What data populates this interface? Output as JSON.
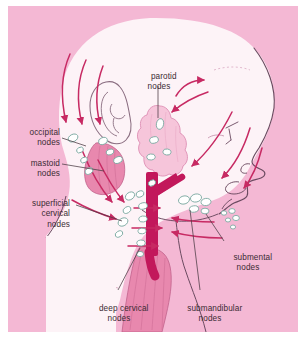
{
  "figure": {
    "panel_background": "#f4b8d4",
    "frame_background": "#ffffff"
  },
  "colors": {
    "panel_pink": "#f4b8d4",
    "skin_white": "#fdf3f7",
    "vessel_crimson": "#c2185b",
    "arrow_crimson": "#c72a63",
    "muscle_pink": "#e888ae",
    "gland_pink": "#f6c5da",
    "outline_purple": "#6b4a60",
    "node_fill": "#ffffff",
    "node_outline": "#7aa8a0",
    "leader_line": "#4a3a42",
    "text": "#3b2b33"
  },
  "labels": [
    {
      "id": "occipital",
      "name": "occipital-nodes-label",
      "lines": [
        "occipital",
        "nodes"
      ],
      "align": "right",
      "x": 14,
      "y": 123
    },
    {
      "id": "mastoid",
      "name": "mastoid-nodes-label",
      "lines": [
        "mastoid",
        "nodes"
      ],
      "align": "right",
      "x": 14,
      "y": 154
    },
    {
      "id": "superficial",
      "name": "superficial-cervical-nodes-label",
      "lines": [
        "superficial",
        "cervical",
        "nodes"
      ],
      "align": "right",
      "x": 8,
      "y": 194
    },
    {
      "id": "parotid",
      "name": "parotid-nodes-label",
      "lines": [
        "parotid",
        "nodes"
      ],
      "align": "center",
      "x": 140,
      "y": 65
    },
    {
      "id": "submental",
      "name": "submental-nodes-label",
      "lines": [
        "submental",
        "nodes"
      ],
      "align": "center",
      "x": 213,
      "y": 246
    },
    {
      "id": "deepcerv",
      "name": "deep-cervical-nodes-label",
      "lines": [
        "deep cervical",
        "nodes"
      ],
      "align": "center",
      "x": 84,
      "y": 297
    },
    {
      "id": "submand",
      "name": "submandibular-nodes-label",
      "lines": [
        "submandibular",
        "nodes"
      ],
      "align": "center",
      "x": 176,
      "y": 297
    }
  ],
  "anatomy": {
    "structures": [
      {
        "name": "head-profile",
        "description": "lateral outline of head, face and neck"
      },
      {
        "name": "ear-outline",
        "description": "auricle drawn in outline on side of head"
      },
      {
        "name": "parotid-gland",
        "description": "lobulated parotid gland containing parotid nodes"
      },
      {
        "name": "internal-jugular-vein",
        "description": "Y-shaped deep crimson great vein of the neck"
      },
      {
        "name": "sternocleidomastoid-muscle",
        "description": "striated pink muscle descending in the neck"
      },
      {
        "name": "trapezius-muscle",
        "description": "striated pink muscle at the back of the neck"
      }
    ],
    "node_groups": [
      {
        "name": "occipital-node-group",
        "count": 4,
        "region": "posterior scalp base"
      },
      {
        "name": "mastoid-node-group",
        "count": 3,
        "region": "behind the ear"
      },
      {
        "name": "parotid-node-group",
        "count": 4,
        "region": "within parotid gland"
      },
      {
        "name": "superficial-cervical-node-group",
        "count": 4,
        "region": "along external jugular"
      },
      {
        "name": "deep-cervical-node-group",
        "count": 7,
        "region": "along internal jugular vein"
      },
      {
        "name": "submandibular-node-group",
        "count": 5,
        "region": "beneath mandible"
      },
      {
        "name": "submental-node-group",
        "count": 5,
        "region": "beneath chin"
      }
    ],
    "flow_arrows": {
      "description": "crimson arrows showing direction of lymph drainage toward the deep cervical chain",
      "count": 16
    }
  }
}
